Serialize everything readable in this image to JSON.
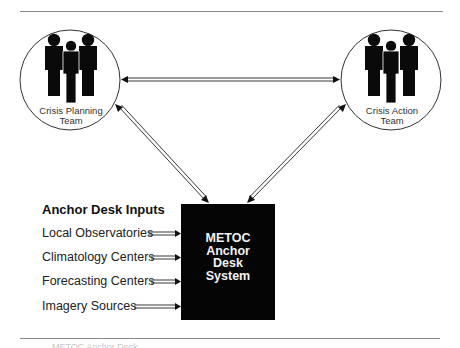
{
  "diagram": {
    "teams": [
      {
        "id": "planning",
        "label_line1": "Crisis Planning",
        "label_line2": "Team",
        "icon": "people-group-icon"
      },
      {
        "id": "action",
        "label_line1": "Crisis Action",
        "label_line2": "Team",
        "icon": "people-group-icon"
      }
    ],
    "system": {
      "lines": [
        "METOC",
        "Anchor",
        "Desk",
        "System"
      ],
      "fill": "#050505",
      "text_color": "#f2f2f2"
    },
    "inputs": {
      "title": "Anchor Desk Inputs",
      "items": [
        {
          "label": "Local Observatories"
        },
        {
          "label": "Climatology Centers"
        },
        {
          "label": "Forecasting Centers"
        },
        {
          "label": "Imagery Sources"
        }
      ]
    },
    "connections": [
      {
        "from": "Crisis Planning Team",
        "to": "Crisis Action Team",
        "type": "bidirectional"
      },
      {
        "from": "Crisis Planning Team",
        "to": "METOC Anchor Desk System",
        "type": "bidirectional"
      },
      {
        "from": "Crisis Action Team",
        "to": "METOC Anchor Desk System",
        "type": "bidirectional"
      },
      {
        "from": "Local Observatories",
        "to": "METOC Anchor Desk System",
        "type": "input"
      },
      {
        "from": "Climatology Centers",
        "to": "METOC Anchor Desk System",
        "type": "input"
      },
      {
        "from": "Forecasting Centers",
        "to": "METOC Anchor Desk System",
        "type": "input"
      },
      {
        "from": "Imagery Sources",
        "to": "METOC Anchor Desk System",
        "type": "input"
      }
    ],
    "caption_partial": "... METOC Anchor Desk ..."
  }
}
